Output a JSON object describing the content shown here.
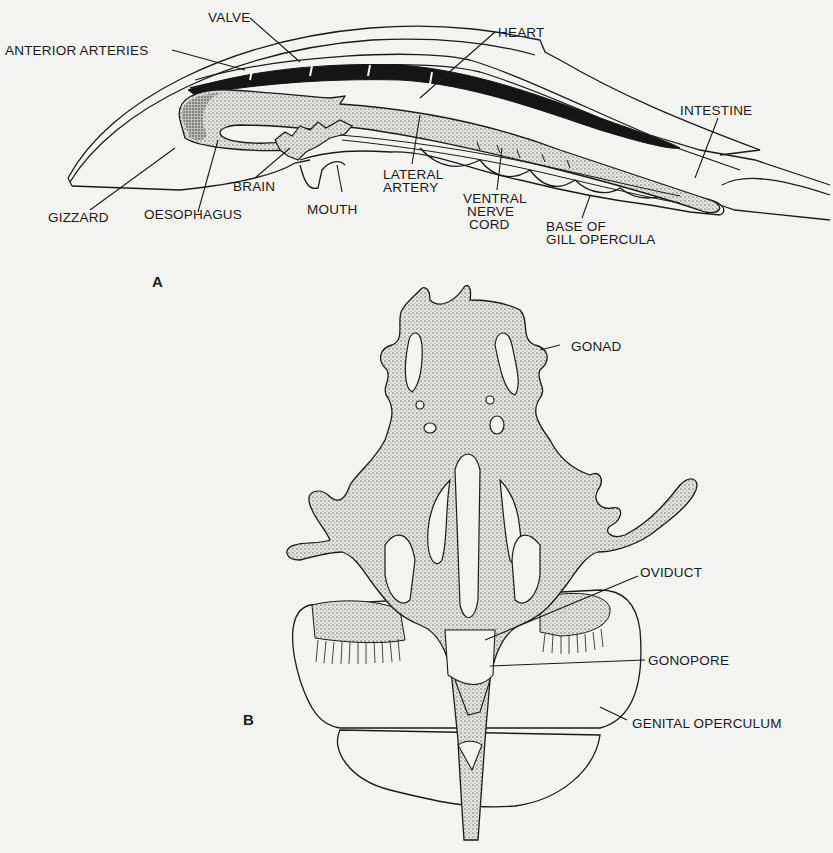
{
  "figure": {
    "panel_a": {
      "letter": "A",
      "labels": {
        "valve": "VALVE",
        "anterior_arteries": "ANTERIOR ARTERIES",
        "heart": "HEART",
        "intestine": "INTESTINE",
        "gizzard": "GIZZARD",
        "oesophagus": "OESOPHAGUS",
        "brain": "BRAIN",
        "mouth": "MOUTH",
        "lateral_artery_1": "LATERAL",
        "lateral_artery_2": "ARTERY",
        "ventral_nerve_cord_1": "VENTRAL",
        "ventral_nerve_cord_2": "NERVE",
        "ventral_nerve_cord_3": "CORD",
        "base_gill_opercula_1": "BASE OF",
        "base_gill_opercula_2": "GILL OPERCULA"
      }
    },
    "panel_b": {
      "letter": "B",
      "labels": {
        "gonad": "GONAD",
        "oviduct": "OVIDUCT",
        "gonopore": "GONOPORE",
        "genital_operculum": "GENITAL OPERCULUM"
      }
    },
    "colors": {
      "background": "#f3f3f1",
      "ink": "#1a1a1a",
      "stipple": "#c9c9c6"
    }
  }
}
